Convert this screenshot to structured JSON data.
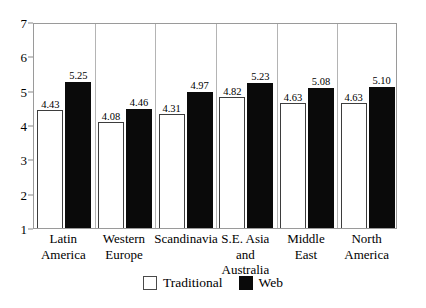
{
  "chart_data": {
    "type": "bar",
    "title": "",
    "subtitle": "",
    "xlabel": "",
    "ylabel": "",
    "grid": false,
    "legend_position": "bottom-center",
    "ylim": [
      1,
      7
    ],
    "yticks": [
      "1",
      "2",
      "3",
      "4",
      "5",
      "6",
      "7"
    ],
    "categories": [
      "Latin\nAmerica",
      "Western\nEurope",
      "Scandinavia",
      "S.E. Asia\nand Australia",
      "Middle\nEast",
      "North\nAmerica"
    ],
    "category_lines": [
      [
        "Latin",
        "America"
      ],
      [
        "Western",
        "Europe"
      ],
      [
        "Scandinavia",
        ""
      ],
      [
        "S.E. Asia",
        "and Australia"
      ],
      [
        "Middle",
        "East"
      ],
      [
        "North",
        "America"
      ]
    ],
    "series": [
      {
        "name": "Traditional",
        "color": "#ffffff",
        "values": [
          4.43,
          4.08,
          4.31,
          4.82,
          4.63,
          4.63
        ],
        "labels": [
          "4.43",
          "4.08",
          "4.31",
          "4.82",
          "4.63",
          "4.63"
        ]
      },
      {
        "name": "Web",
        "color": "#0a0a0a",
        "values": [
          5.25,
          4.46,
          4.97,
          5.23,
          5.08,
          5.1
        ],
        "labels": [
          "5.25",
          "4.46",
          "4.97",
          "5.23",
          "5.08",
          "5.10"
        ]
      }
    ]
  },
  "legend": {
    "items": [
      {
        "label": "Traditional",
        "style": "traditional"
      },
      {
        "label": "Web",
        "style": "web"
      }
    ]
  }
}
